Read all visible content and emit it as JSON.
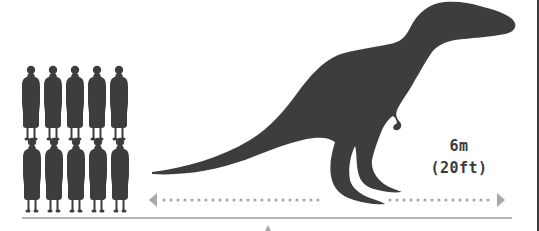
{
  "figure": {
    "people_count": 10,
    "people_rows": 2,
    "people_per_row": 5
  },
  "measurement": {
    "metric": "6m",
    "imperial": "(20ft)"
  },
  "colors": {
    "silhouette": "#3d3d3d",
    "arrow": "#a8a8a8",
    "baseline": "#b5b5b5",
    "border": "#3d3d3d",
    "text": "#3a3a3a"
  }
}
